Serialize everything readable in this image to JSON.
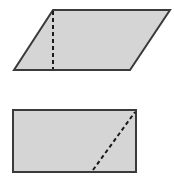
{
  "page": {
    "background_color": "#ffffff",
    "width": 174,
    "height": 194
  },
  "style": {
    "shape_fill": "#d5d5d5",
    "shape_stroke": "#3a3a3a",
    "shape_stroke_width": 2,
    "dashed_stroke": "#1a1a1a",
    "dashed_stroke_width": 2,
    "dash_pattern": "4,3"
  },
  "figures": [
    {
      "name": "parallelogram",
      "shape_type": "parallelogram",
      "label": "Parallelogram with vertical dashed height segment",
      "points": "53,10 170,10 130,70 14,70",
      "vertices": [
        {
          "name": "top-left",
          "x": 53,
          "y": 10
        },
        {
          "name": "top-right",
          "x": 170,
          "y": 10
        },
        {
          "name": "bottom-right",
          "x": 130,
          "y": 70
        },
        {
          "name": "bottom-left",
          "x": 14,
          "y": 70
        }
      ],
      "dashed_segment": {
        "name": "vertical-height-line",
        "x1": 53,
        "y1": 11,
        "x2": 53,
        "y2": 69
      }
    },
    {
      "name": "rectangle",
      "shape_type": "rectangle",
      "label": "Rectangle with dashed diagonal segment",
      "points": "13,110 136,110 136,172 13,172",
      "vertices": [
        {
          "name": "top-left",
          "x": 13,
          "y": 110
        },
        {
          "name": "top-right",
          "x": 136,
          "y": 110
        },
        {
          "name": "bottom-right",
          "x": 136,
          "y": 172
        },
        {
          "name": "bottom-left",
          "x": 13,
          "y": 172
        }
      ],
      "dashed_segment": {
        "name": "diagonal-line",
        "x1": 93,
        "y1": 170,
        "x2": 135,
        "y2": 112
      }
    }
  ]
}
